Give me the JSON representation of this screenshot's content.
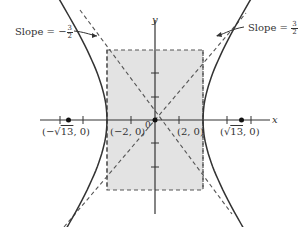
{
  "diagram": {
    "type": "hyperbola",
    "equation": "x^2/4 - y^2/9 = 1",
    "axes": {
      "x_label": "x",
      "y_label": "y",
      "origin_label": "0"
    },
    "annotations": {
      "slope_left": {
        "prefix": "Slope = −",
        "num": "3",
        "den": "2"
      },
      "slope_right": {
        "prefix": "Slope = ",
        "num": "3",
        "den": "2"
      }
    },
    "points": {
      "foci_left": "(−√13, 0)",
      "foci_left_parts": {
        "open": "(−",
        "radical": "√",
        "radicand": "13",
        "close": ", 0)"
      },
      "vertex_left": "(−2, 0)",
      "vertex_right": "(2, 0)",
      "foci_right": "(√13, 0)",
      "foci_right_parts": {
        "open": "(",
        "radical": "√",
        "radicand": "13",
        "close": ", 0)"
      }
    },
    "parameters": {
      "a": 2,
      "b": 3,
      "c": "√13",
      "asymptote_slopes": [
        1.5,
        -1.5
      ]
    },
    "colors": {
      "shaded_box": "#e3e3e3",
      "curve": "#333333",
      "dashed": "#555555",
      "axis": "#333333"
    }
  }
}
